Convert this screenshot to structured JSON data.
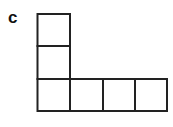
{
  "panel_label": "c",
  "shape": {
    "description": "L-shaped arrangement of 6 unit squares",
    "cell_size": 33,
    "stroke_color": "#222222",
    "cells": [
      {
        "col": 0,
        "row": 0
      },
      {
        "col": 0,
        "row": 1
      },
      {
        "col": 0,
        "row": 2
      },
      {
        "col": 1,
        "row": 2
      },
      {
        "col": 2,
        "row": 2
      },
      {
        "col": 3,
        "row": 2
      }
    ]
  }
}
